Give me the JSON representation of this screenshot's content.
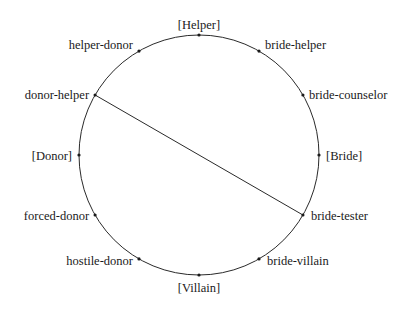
{
  "diagram": {
    "type": "circular-role-diagram",
    "circle": {
      "cx": 199,
      "cy": 155,
      "r": 120
    },
    "nodes": [
      {
        "id": "helper",
        "label": "[Helper]",
        "angle": 90,
        "anchor": "middle",
        "dx": 0,
        "dy": -6
      },
      {
        "id": "bride-helper",
        "label": "bride-helper",
        "angle": 60,
        "anchor": "start",
        "dx": 6,
        "dy": -2
      },
      {
        "id": "bride-counselor",
        "label": "bride-counselor",
        "angle": 30,
        "anchor": "start",
        "dx": 6,
        "dy": 4
      },
      {
        "id": "bride",
        "label": "[Bride]",
        "angle": 0,
        "anchor": "start",
        "dx": 7,
        "dy": 5
      },
      {
        "id": "bride-tester",
        "label": "bride-tester",
        "angle": -30,
        "anchor": "start",
        "dx": 8,
        "dy": 5
      },
      {
        "id": "bride-villain",
        "label": "bride-villain",
        "angle": -60,
        "anchor": "start",
        "dx": 8,
        "dy": 6
      },
      {
        "id": "villain",
        "label": "[Villain]",
        "angle": -90,
        "anchor": "middle",
        "dx": 0,
        "dy": 17
      },
      {
        "id": "hostile-donor",
        "label": "hostile-donor",
        "angle": -120,
        "anchor": "end",
        "dx": -6,
        "dy": 6
      },
      {
        "id": "forced-donor",
        "label": "forced-donor",
        "angle": -150,
        "anchor": "end",
        "dx": -6,
        "dy": 5
      },
      {
        "id": "donor",
        "label": "[Donor]",
        "angle": 180,
        "anchor": "end",
        "dx": -7,
        "dy": 5
      },
      {
        "id": "donor-helper",
        "label": "donor-helper",
        "angle": 150,
        "anchor": "end",
        "dx": -6,
        "dy": 4
      },
      {
        "id": "helper-donor",
        "label": "helper-donor",
        "angle": 120,
        "anchor": "end",
        "dx": -6,
        "dy": -2
      }
    ],
    "edges": [
      {
        "from": "donor-helper",
        "to": "bride-tester"
      }
    ]
  }
}
